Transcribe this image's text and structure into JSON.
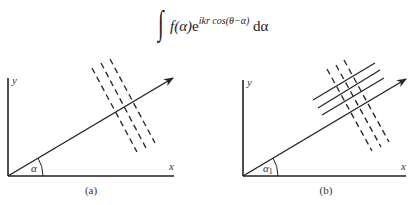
{
  "formula": {
    "integral_sign": "∫",
    "integrand_before": "f(α)",
    "e": "e",
    "exponent": "ikr cos(θ−α)",
    "differential": " dα"
  },
  "panels": [
    {
      "caption": "(a)",
      "x_label": "x",
      "y_label": "y",
      "angle_label": "α",
      "wavefronts": "dashed",
      "dashed_count": 3,
      "solid_count": 0
    },
    {
      "caption": "(b)",
      "x_label": "x",
      "y_label": "y",
      "angle_label": "α",
      "angle_subscript": "1",
      "wavefronts": "dashed+solid",
      "dashed_count": 3,
      "solid_count": 3
    }
  ],
  "colors": {
    "line": "#222222",
    "background": "#ffffff"
  }
}
